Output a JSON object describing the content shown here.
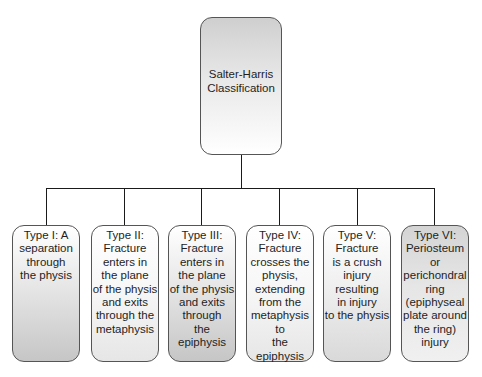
{
  "root": {
    "label": "Salter-Harris\nClassification"
  },
  "types": [
    {
      "id": "type-i",
      "label": "Type I: A\nseparation\nthrough\nthe physis"
    },
    {
      "id": "type-ii",
      "label": "Type II:\nFracture\nenters in\nthe plane\nof the physis\nand exits\nthrough the\nmetaphysis"
    },
    {
      "id": "type-iii",
      "label": "Type III:\nFracture\nenters in\nthe plane\nof the physis\nand exits\nthrough\nthe epiphysis"
    },
    {
      "id": "type-iv",
      "label": "Type IV:\nFracture\ncrosses the\nphysis,\nextending\nfrom the\nmetaphysis to\nthe epiphysis"
    },
    {
      "id": "type-v",
      "label": "Type V:\nFracture\nis a crush\ninjury\nresulting\nin injury\nto the physis"
    },
    {
      "id": "type-vi",
      "label": "Type VI:\nPeriosteum or\nperichondral\nring\n(epiphyseal\nplate around\nthe ring)\ninjury"
    }
  ],
  "colors": {
    "line": "#1a1a1a",
    "border": "#555555",
    "shade_dark": "#c6c6c6",
    "shade_light": "#e6e6e6"
  }
}
